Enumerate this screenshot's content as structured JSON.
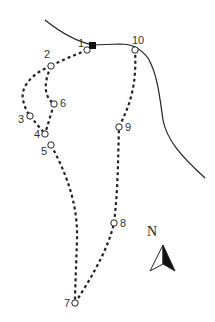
{
  "map": {
    "north_label": "N",
    "points": [
      {
        "id": "1",
        "label": "1",
        "x": 87,
        "y": 50
      },
      {
        "id": "2",
        "label": "2",
        "x": 51,
        "y": 66
      },
      {
        "id": "3",
        "label": "3",
        "x": 30,
        "y": 116
      },
      {
        "id": "4",
        "label": "4",
        "x": 45,
        "y": 134
      },
      {
        "id": "5",
        "label": "5",
        "x": 51,
        "y": 145
      },
      {
        "id": "6",
        "label": "6",
        "x": 54,
        "y": 104
      },
      {
        "id": "7",
        "label": "7",
        "x": 75,
        "y": 303
      },
      {
        "id": "8",
        "label": "8",
        "x": 114,
        "y": 223
      },
      {
        "id": "9",
        "label": "9",
        "x": 119,
        "y": 127
      },
      {
        "id": "10",
        "label": "10",
        "x": 135,
        "y": 50
      }
    ],
    "colors": {
      "line": "#222222",
      "marker_fill": "#ffffff",
      "start_marker": "#111111"
    }
  }
}
